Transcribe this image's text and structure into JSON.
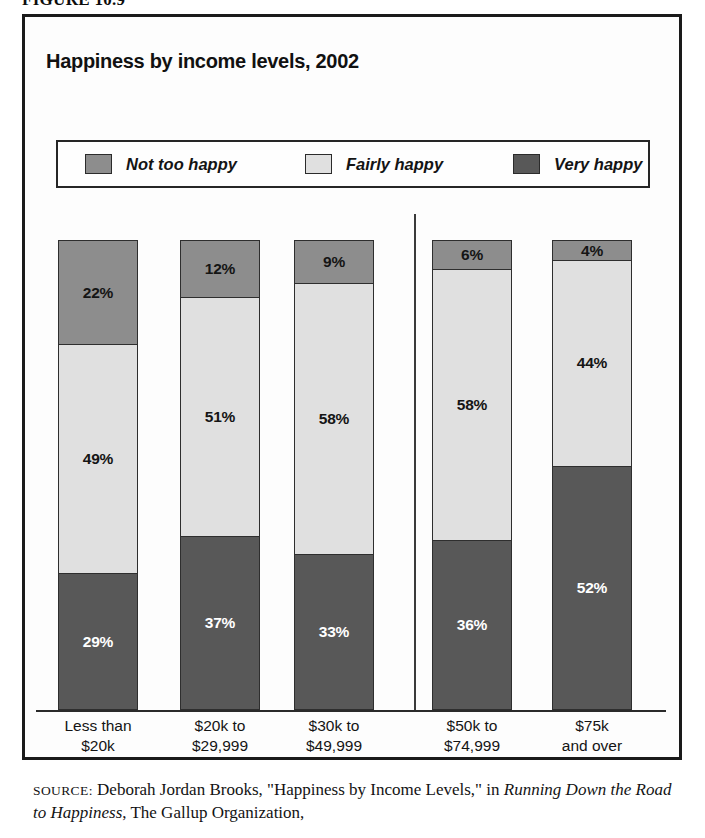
{
  "figure_caption": "FIGURE 10.9",
  "chart_title": "Happiness by income levels, 2002",
  "legend": {
    "items": [
      {
        "label": "Not too happy",
        "color": "#8d8d8d"
      },
      {
        "label": "Fairly happy",
        "color": "#e0e0e0"
      },
      {
        "label": "Very happy",
        "color": "#585858"
      }
    ]
  },
  "source": {
    "prefix": "SOURCE:",
    "part1": " Deborah Jordan Brooks, \"Happiness by Income Levels,\" in ",
    "italic": "Running Down the Road to Happiness",
    "part2": ", The Gallup Organization,"
  },
  "chart_data": {
    "type": "bar",
    "subtype": "stacked-vertical-100pct",
    "title": "Happiness by income levels, 2002",
    "xlabel": "",
    "ylabel": "",
    "ylim": [
      0,
      100
    ],
    "grid": false,
    "legend_position": "top",
    "categories": [
      "Less than $20k",
      "$20k to $29,999",
      "$30k to $49,999",
      "$50k to $74,999",
      "$75k and over"
    ],
    "category_lines": [
      [
        "Less than",
        "$20k"
      ],
      [
        "$20k to",
        "$29,999"
      ],
      [
        "$30k to",
        "$49,999"
      ],
      [
        "$50k to",
        "$74,999"
      ],
      [
        "$75k",
        "and over"
      ]
    ],
    "series": [
      {
        "name": "Not too happy",
        "color": "#8d8d8d",
        "values": [
          22,
          12,
          9,
          6,
          4
        ],
        "labels": [
          "22%",
          "12%",
          "9%",
          "6%",
          "4%"
        ]
      },
      {
        "name": "Fairly happy",
        "color": "#e0e0e0",
        "values": [
          49,
          51,
          58,
          58,
          44
        ],
        "labels": [
          "49%",
          "51%",
          "58%",
          "58%",
          "44%"
        ]
      },
      {
        "name": "Very happy",
        "color": "#585858",
        "values": [
          29,
          37,
          33,
          36,
          52
        ],
        "labels": [
          "29%",
          "37%",
          "33%",
          "36%",
          "52%"
        ]
      }
    ],
    "annotations": {
      "group_divider_after_category_index": 2
    }
  },
  "bars": [
    {
      "x": 36,
      "label_x": 14,
      "top": {
        "value": 22,
        "text": "22%"
      },
      "mid": {
        "value": 49,
        "text": "49%"
      },
      "bot": {
        "value": 29,
        "text": "29%"
      }
    },
    {
      "x": 158,
      "label_x": 136,
      "top": {
        "value": 12,
        "text": "12%"
      },
      "mid": {
        "value": 51,
        "text": "51%"
      },
      "bot": {
        "value": 37,
        "text": "37%"
      }
    },
    {
      "x": 272,
      "label_x": 250,
      "top": {
        "value": 9,
        "text": "9%"
      },
      "mid": {
        "value": 58,
        "text": "58%"
      },
      "bot": {
        "value": 33,
        "text": "33%"
      }
    },
    {
      "x": 410,
      "label_x": 388,
      "top": {
        "value": 6,
        "text": "6%"
      },
      "mid": {
        "value": 58,
        "text": "58%"
      },
      "bot": {
        "value": 36,
        "text": "36%"
      }
    },
    {
      "x": 530,
      "label_x": 508,
      "top": {
        "value": 4,
        "text": "4%"
      },
      "mid": {
        "value": 44,
        "text": "44%"
      },
      "bot": {
        "value": 52,
        "text": "52%"
      }
    }
  ]
}
